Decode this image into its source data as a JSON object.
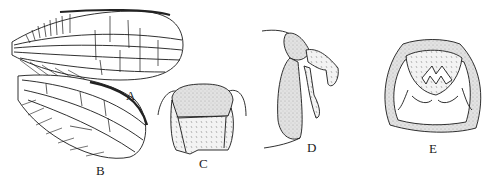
{
  "figure": {
    "panels": [
      {
        "id": "A",
        "label": "A",
        "subject": "forewing"
      },
      {
        "id": "B",
        "label": "B",
        "subject": "hindwing"
      },
      {
        "id": "C",
        "label": "C",
        "subject": "head, frontal view"
      },
      {
        "id": "D",
        "label": "D",
        "subject": "genitalia, lateral view"
      },
      {
        "id": "E",
        "label": "E",
        "subject": "genitalia, caudal view"
      }
    ],
    "colors": {
      "ink": "#1a1a1a",
      "stipple": "#d8d8d8",
      "background": "#ffffff"
    }
  }
}
